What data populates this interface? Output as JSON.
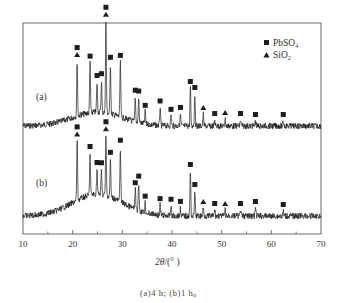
{
  "chart_data": {
    "type": "line",
    "title": "",
    "xlabel": "2θ/(°)",
    "ylabel": "",
    "xlim": [
      10,
      70
    ],
    "x_ticks": [
      10,
      20,
      30,
      40,
      50,
      60,
      70
    ],
    "x_minor_ticks": [
      15,
      25,
      35,
      45,
      55,
      65
    ],
    "grid": false,
    "legend": {
      "position": "upper right",
      "entries": [
        {
          "marker": "square",
          "label": "PbSO4",
          "display": "PbSO₄"
        },
        {
          "marker": "triangle",
          "label": "SiO2",
          "display": "SiO₂"
        }
      ]
    },
    "series": [
      {
        "name": "(a)",
        "description": "4 h",
        "baseline_relative": 0.0,
        "peaks": [
          {
            "two_theta": 20.9,
            "rel_intensity": 0.55,
            "phases": [
              "PbSO4",
              "SiO2"
            ]
          },
          {
            "two_theta": 23.5,
            "rel_intensity": 0.5,
            "phases": [
              "PbSO4"
            ]
          },
          {
            "two_theta": 24.9,
            "rel_intensity": 0.3,
            "phases": [
              "PbSO4"
            ]
          },
          {
            "two_theta": 25.8,
            "rel_intensity": 0.32,
            "phases": [
              "PbSO4"
            ]
          },
          {
            "two_theta": 26.7,
            "rel_intensity": 0.92,
            "phases": [
              "PbSO4",
              "SiO2"
            ]
          },
          {
            "two_theta": 27.6,
            "rel_intensity": 0.5,
            "phases": [
              "PbSO4"
            ]
          },
          {
            "two_theta": 29.6,
            "rel_intensity": 0.55,
            "phases": [
              "PbSO4"
            ]
          },
          {
            "two_theta": 32.6,
            "rel_intensity": 0.25,
            "phases": [
              "PbSO4"
            ]
          },
          {
            "two_theta": 33.3,
            "rel_intensity": 0.25,
            "phases": [
              "PbSO4"
            ]
          },
          {
            "two_theta": 34.6,
            "rel_intensity": 0.12,
            "phases": [
              "PbSO4"
            ]
          },
          {
            "two_theta": 37.6,
            "rel_intensity": 0.18,
            "phases": [
              "PbSO4"
            ]
          },
          {
            "two_theta": 39.8,
            "rel_intensity": 0.1,
            "phases": [
              "PbSO4"
            ]
          },
          {
            "two_theta": 41.7,
            "rel_intensity": 0.12,
            "phases": [
              "PbSO4"
            ]
          },
          {
            "two_theta": 43.7,
            "rel_intensity": 0.38,
            "phases": [
              "PbSO4"
            ]
          },
          {
            "two_theta": 44.6,
            "rel_intensity": 0.32,
            "phases": [
              "PbSO4"
            ]
          },
          {
            "two_theta": 46.3,
            "rel_intensity": 0.12,
            "phases": [
              "SiO2"
            ]
          },
          {
            "two_theta": 48.6,
            "rel_intensity": 0.06,
            "phases": [
              "PbSO4"
            ]
          },
          {
            "two_theta": 50.7,
            "rel_intensity": 0.07,
            "phases": [
              "SiO2"
            ]
          },
          {
            "two_theta": 53.8,
            "rel_intensity": 0.06,
            "phases": [
              "PbSO4"
            ]
          },
          {
            "two_theta": 56.8,
            "rel_intensity": 0.05,
            "phases": [
              "PbSO4"
            ]
          },
          {
            "two_theta": 62.4,
            "rel_intensity": 0.05,
            "phases": [
              "PbSO4"
            ]
          }
        ]
      },
      {
        "name": "(b)",
        "description": "1 h",
        "peaks": [
          {
            "two_theta": 20.9,
            "rel_intensity": 0.6,
            "phases": [
              "PbSO4",
              "SiO2"
            ]
          },
          {
            "two_theta": 23.5,
            "rel_intensity": 0.42,
            "phases": [
              "PbSO4"
            ]
          },
          {
            "two_theta": 24.9,
            "rel_intensity": 0.25,
            "phases": [
              "PbSO4"
            ]
          },
          {
            "two_theta": 25.8,
            "rel_intensity": 0.25,
            "phases": [
              "PbSO4"
            ]
          },
          {
            "two_theta": 26.7,
            "rel_intensity": 0.6,
            "phases": [
              "PbSO4",
              "SiO2"
            ]
          },
          {
            "two_theta": 27.6,
            "rel_intensity": 0.38,
            "phases": [
              "PbSO4"
            ]
          },
          {
            "two_theta": 29.6,
            "rel_intensity": 0.55,
            "phases": [
              "PbSO4"
            ]
          },
          {
            "two_theta": 32.6,
            "rel_intensity": 0.2,
            "phases": [
              "PbSO4"
            ]
          },
          {
            "two_theta": 33.3,
            "rel_intensity": 0.28,
            "phases": [
              "PbSO4"
            ]
          },
          {
            "two_theta": 34.6,
            "rel_intensity": 0.1,
            "phases": [
              "PbSO4"
            ]
          },
          {
            "two_theta": 37.6,
            "rel_intensity": 0.1,
            "phases": [
              "PbSO4"
            ]
          },
          {
            "two_theta": 39.8,
            "rel_intensity": 0.1,
            "phases": [
              "PbSO4"
            ]
          },
          {
            "two_theta": 41.7,
            "rel_intensity": 0.08,
            "phases": [
              "PbSO4"
            ]
          },
          {
            "two_theta": 43.7,
            "rel_intensity": 0.45,
            "phases": [
              "PbSO4"
            ]
          },
          {
            "two_theta": 44.6,
            "rel_intensity": 0.25,
            "phases": [
              "PbSO4"
            ]
          },
          {
            "two_theta": 46.3,
            "rel_intensity": 0.08,
            "phases": [
              "SiO2"
            ]
          },
          {
            "two_theta": 48.6,
            "rel_intensity": 0.06,
            "phases": [
              "PbSO4"
            ]
          },
          {
            "two_theta": 50.7,
            "rel_intensity": 0.06,
            "phases": [
              "SiO2"
            ]
          },
          {
            "two_theta": 53.8,
            "rel_intensity": 0.06,
            "phases": [
              "PbSO4"
            ]
          },
          {
            "two_theta": 56.8,
            "rel_intensity": 0.08,
            "phases": [
              "PbSO4"
            ]
          },
          {
            "two_theta": 62.4,
            "rel_intensity": 0.05,
            "phases": [
              "PbSO4"
            ]
          }
        ]
      }
    ],
    "annotations": [
      "(a)",
      "(b)"
    ],
    "caption": "(a)4 h; (b)1 h。"
  },
  "labels": {
    "curve_a": "(a)",
    "curve_b": "(b)",
    "legend_pbso4_main": "PbSO",
    "legend_pbso4_sub": "4",
    "legend_sio2_main": "SiO",
    "legend_sio2_sub": "2",
    "x_title_main": "2θ",
    "x_title_unit": "/(° )",
    "caption": "(a)4 h; (b)1 h。"
  },
  "layout": {
    "plot": {
      "left": 23,
      "top": 23,
      "right": 321,
      "bottom": 234
    },
    "curve_a_baseline_y": 126,
    "curve_b_baseline_y": 216,
    "peak_scale_px": 100,
    "line_color": "#1e1e1e",
    "marker_color": "#1e1e1e"
  }
}
